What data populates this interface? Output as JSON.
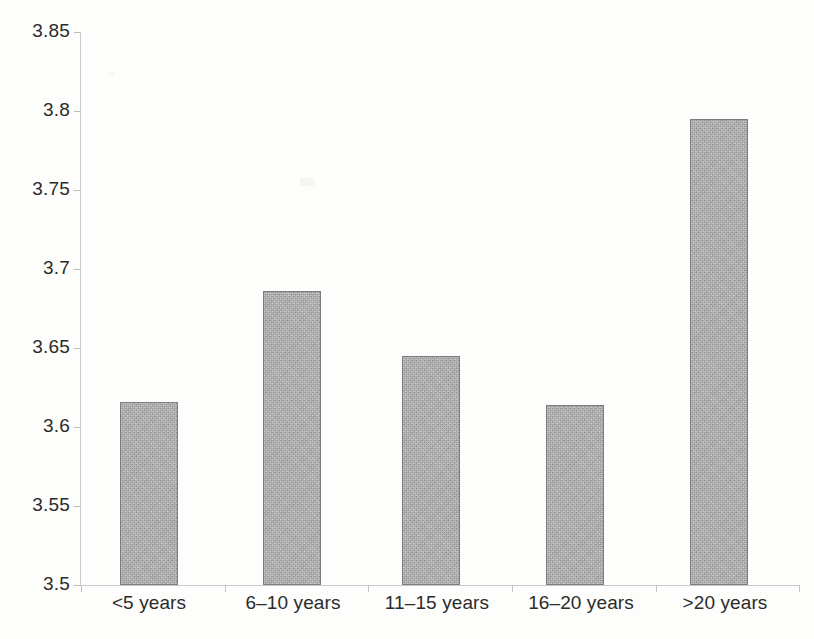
{
  "chart_data": {
    "type": "bar",
    "title": "",
    "subtitle": "",
    "xlabel": "",
    "ylabel": "",
    "categories": [
      "<5 years",
      "6–10 years",
      "11–15 years",
      "16–20 years",
      ">20 years"
    ],
    "values": [
      3.616,
      3.686,
      3.645,
      3.614,
      3.795
    ],
    "series": [
      {
        "name": "",
        "values": [
          3.616,
          3.686,
          3.645,
          3.614,
          3.795
        ]
      }
    ],
    "ylim": [
      3.5,
      3.85
    ],
    "ytick_values": [
      3.5,
      3.55,
      3.6,
      3.65,
      3.7,
      3.75,
      3.8,
      3.85
    ],
    "ytick_labels": [
      "3.5",
      "3.55",
      "3.6",
      "3.65",
      "3.7",
      "3.75",
      "3.8",
      "3.85"
    ],
    "ytick_step": 0.05,
    "grid": false,
    "legend": false,
    "legend_position": "none",
    "annotations": [],
    "bar_color": "#a8a8a8",
    "bar_border_color": "#7c7c7c",
    "axis_color": "#c9c9c9",
    "text_color": "#2b2b2b",
    "background_color": "#fdfdfc"
  },
  "axis": {
    "y_ticks": [
      {
        "label": "3.85",
        "value": 3.85
      },
      {
        "label": "3.8",
        "value": 3.8
      },
      {
        "label": "3.75",
        "value": 3.75
      },
      {
        "label": "3.7",
        "value": 3.7
      },
      {
        "label": "3.65",
        "value": 3.65
      },
      {
        "label": "3.6",
        "value": 3.6
      },
      {
        "label": "3.55",
        "value": 3.55
      },
      {
        "label": "3.5",
        "value": 3.5
      }
    ],
    "x_categories": [
      {
        "label": "<5 years"
      },
      {
        "label": "6–10 years"
      },
      {
        "label": "11–15 years"
      },
      {
        "label": "16–20 years"
      },
      {
        "label": ">20 years"
      }
    ]
  }
}
